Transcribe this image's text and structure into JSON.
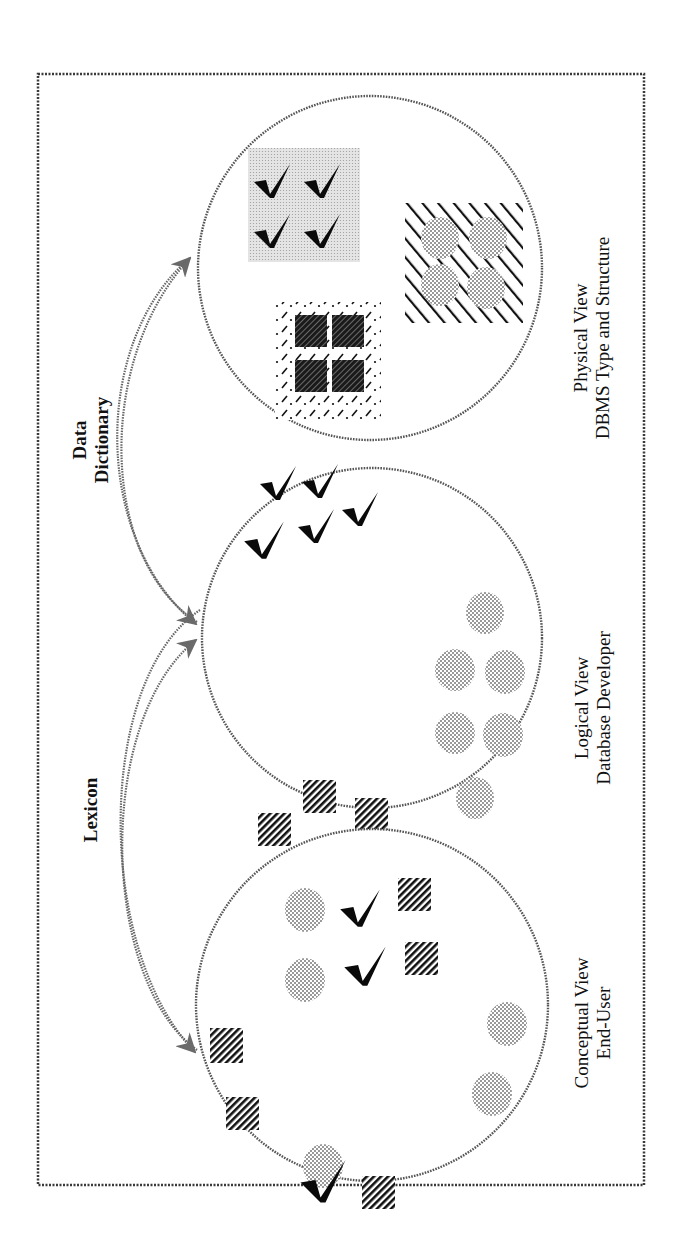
{
  "diagram": {
    "title_orientation": "rotated -90deg",
    "colors": {
      "frame": "#3a3a3a",
      "circle_outline": "#555555",
      "dot_fill": "#8a8a8a",
      "check_fill": "#0a0a0a",
      "hatch": "#111111",
      "light_shade": "#d6d6d6",
      "text": "#111111"
    },
    "frame": {
      "x": 38,
      "y": 74,
      "w": 606,
      "h": 1111
    },
    "connectors": [
      {
        "label_line1": "Lexicon",
        "label_line2": "",
        "from": "conceptual",
        "to": "logical"
      },
      {
        "label_line1": "Data",
        "label_line2": "Dictionary",
        "from": "logical",
        "to": "physical"
      }
    ],
    "views": [
      {
        "id": "physical",
        "title": "Physical View",
        "subtitle": "DBMS Type and Structure",
        "cx": 370,
        "cy": 268,
        "r": 172
      },
      {
        "id": "logical",
        "title": "Logical View",
        "subtitle": "Database Developer",
        "cx": 372,
        "cy": 638,
        "r": 170
      },
      {
        "id": "conceptual",
        "title": "Conceptual View",
        "subtitle": "End-User",
        "cx": 372,
        "cy": 1005,
        "r": 176
      }
    ]
  }
}
